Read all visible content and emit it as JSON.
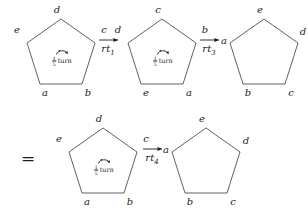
{
  "figure": {
    "stroke_color": "#3a3a3a",
    "text_color": "#1b1b1b",
    "background": "#ffffff",
    "equals_sign": "=",
    "turn_label": {
      "numerator": "1",
      "denominator": "5",
      "word": "turn",
      "icon": "counterclockwise-turn-arrow"
    },
    "operators": [
      {
        "id": "rt1",
        "text": "rt",
        "subscript": "1"
      },
      {
        "id": "rt3",
        "text": "rt",
        "subscript": "3"
      },
      {
        "id": "rt4",
        "text": "rt",
        "subscript": "4"
      }
    ],
    "pentagons": [
      {
        "id": "pentagon-1",
        "row": "top",
        "position": 1,
        "has_turn_label": true,
        "vertices": [
          {
            "name": "d",
            "role": "apex"
          },
          {
            "name": "c",
            "role": "upper-right"
          },
          {
            "name": "b",
            "role": "lower-right"
          },
          {
            "name": "a",
            "role": "lower-left"
          },
          {
            "name": "e",
            "role": "upper-left"
          }
        ]
      },
      {
        "id": "pentagon-2",
        "row": "top",
        "position": 2,
        "has_turn_label": true,
        "vertices": [
          {
            "name": "c",
            "role": "apex"
          },
          {
            "name": "b",
            "role": "upper-right"
          },
          {
            "name": "a",
            "role": "lower-right"
          },
          {
            "name": "e",
            "role": "lower-left"
          },
          {
            "name": "d",
            "role": "upper-left"
          }
        ]
      },
      {
        "id": "pentagon-3",
        "row": "top",
        "position": 3,
        "has_turn_label": false,
        "vertices": [
          {
            "name": "e",
            "role": "apex"
          },
          {
            "name": "d",
            "role": "upper-right"
          },
          {
            "name": "c",
            "role": "lower-right"
          },
          {
            "name": "b",
            "role": "lower-left"
          },
          {
            "name": "a",
            "role": "upper-left"
          }
        ]
      },
      {
        "id": "pentagon-4",
        "row": "bottom",
        "position": 1,
        "has_turn_label": true,
        "vertices": [
          {
            "name": "d",
            "role": "apex"
          },
          {
            "name": "c",
            "role": "upper-right"
          },
          {
            "name": "b",
            "role": "lower-right"
          },
          {
            "name": "a",
            "role": "lower-left"
          },
          {
            "name": "e",
            "role": "upper-left"
          }
        ]
      },
      {
        "id": "pentagon-5",
        "row": "bottom",
        "position": 2,
        "has_turn_label": false,
        "vertices": [
          {
            "name": "e",
            "role": "apex"
          },
          {
            "name": "d",
            "role": "upper-right"
          },
          {
            "name": "c",
            "role": "lower-right"
          },
          {
            "name": "b",
            "role": "lower-left"
          },
          {
            "name": "a",
            "role": "upper-left"
          }
        ]
      }
    ]
  }
}
